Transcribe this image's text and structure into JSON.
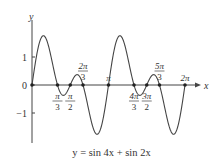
{
  "chart_data": {
    "type": "line",
    "title": "",
    "caption": "y = sin 4x + sin 2x",
    "function": "sin(4x) + sin(2x)",
    "xlabel": "x",
    "ylabel": "y",
    "xlim": [
      0,
      6.2832
    ],
    "ylim": [
      -1.76,
      1.76
    ],
    "grid": false,
    "legend": null,
    "x_tick_labels": [
      {
        "num": "π",
        "den": "3",
        "value": 1.0472,
        "position": "below"
      },
      {
        "num": "π",
        "den": "2",
        "value": 1.5708,
        "position": "below"
      },
      {
        "num": "2π",
        "den": "3",
        "value": 2.0944,
        "position": "above"
      },
      {
        "num": "π",
        "den": "",
        "value": 3.1416,
        "position": "above"
      },
      {
        "num": "4π",
        "den": "3",
        "value": 4.1888,
        "position": "below"
      },
      {
        "num": "3π",
        "den": "2",
        "value": 4.7124,
        "position": "below"
      },
      {
        "num": "5π",
        "den": "3",
        "value": 5.236,
        "position": "above"
      },
      {
        "num": "2π",
        "den": "",
        "value": 6.2832,
        "position": "above"
      }
    ],
    "y_tick_labels": [
      {
        "label": "1",
        "value": 1
      },
      {
        "label": "0",
        "value": 0
      },
      {
        "label": "−1",
        "value": -1
      }
    ],
    "zeros": [
      0,
      1.0472,
      1.5708,
      2.0944,
      3.1416,
      4.1888,
      4.7124,
      5.236,
      6.2832
    ],
    "series": [
      {
        "name": "y = sin 4x + sin 2x",
        "x": [
          0,
          0.3927,
          0.7854,
          1.0472,
          1.3,
          1.5708,
          1.85,
          2.0944,
          2.3562,
          2.75,
          3.1416,
          3.5343,
          3.927,
          4.1888,
          4.44,
          4.7124,
          4.99,
          5.236,
          5.4978,
          5.89,
          6.2832
        ],
        "values": [
          0,
          1.71,
          1.0,
          0,
          -0.35,
          0,
          0.35,
          0,
          -1.0,
          -1.71,
          0,
          1.71,
          1.0,
          0,
          -0.35,
          0,
          0.35,
          0,
          -1.0,
          -1.71,
          0
        ]
      }
    ]
  }
}
